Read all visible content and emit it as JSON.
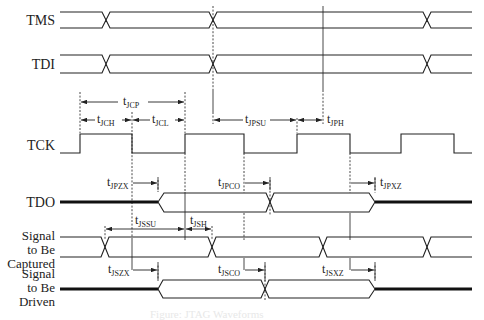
{
  "signals": {
    "tms": "TMS",
    "tdi": "TDI",
    "tck": "TCK",
    "tdo": "TDO",
    "captured": [
      "Signal",
      "to Be",
      "Captured"
    ],
    "driven": [
      "Signal",
      "to Be",
      "Driven"
    ]
  },
  "timing_params": {
    "jcp": {
      "base": "t",
      "sub": "JCP"
    },
    "jch": {
      "base": "t",
      "sub": "JCH"
    },
    "jcl": {
      "base": "t",
      "sub": "JCL"
    },
    "jpsu": {
      "base": "t",
      "sub": "JPSU"
    },
    "jph": {
      "base": "t",
      "sub": "JPH"
    },
    "jpzx": {
      "base": "t",
      "sub": "JPZX"
    },
    "jpco": {
      "base": "t",
      "sub": "JPCO"
    },
    "jpxz": {
      "base": "t",
      "sub": "JPXZ"
    },
    "jssu": {
      "base": "t",
      "sub": "JSSU"
    },
    "jsh": {
      "base": "t",
      "sub": "JSH"
    },
    "jszx": {
      "base": "t",
      "sub": "JSZX"
    },
    "jsco": {
      "base": "t",
      "sub": "JSCO"
    },
    "jsxz": {
      "base": "t",
      "sub": "JSXZ"
    }
  },
  "caption": "Figure: JTAG Waveforms",
  "colors": {
    "line": "#222222",
    "background": "#ffffff"
  }
}
